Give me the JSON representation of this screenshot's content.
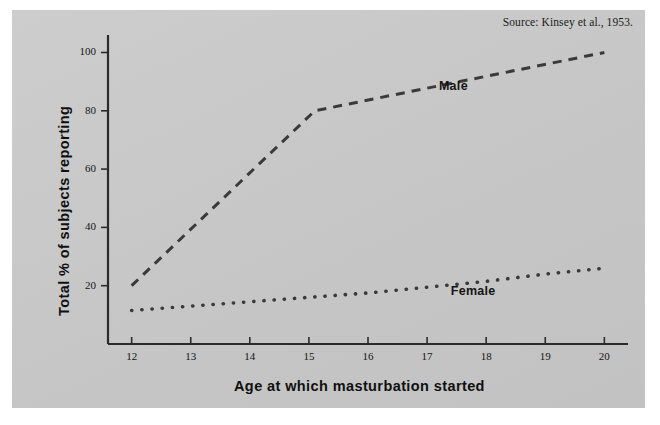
{
  "source_note": "Source: Kinsey et al., 1953.",
  "chart_data": {
    "type": "line",
    "title": "",
    "xlabel": "Age at which masturbation started",
    "ylabel": "Total % of subjects reporting",
    "x": [
      12,
      13,
      14,
      15,
      16,
      17,
      18,
      19,
      20
    ],
    "xtick_labels": [
      "12",
      "13",
      "14",
      "15",
      "16",
      "17",
      "18",
      "19",
      "20"
    ],
    "ytick_labels": [
      "20",
      "40",
      "60",
      "80",
      "100"
    ],
    "yticks": [
      20,
      40,
      60,
      80,
      100
    ],
    "xlim": [
      11.6,
      20.4
    ],
    "ylim": [
      0,
      106
    ],
    "grid": false,
    "legend_position": "inline-annotation",
    "series": [
      {
        "name": "Male",
        "style": "dashed",
        "color": "#3a3a3a",
        "label_x": 17.2,
        "label_y": 88,
        "x": [
          12,
          15.1,
          20
        ],
        "values": [
          20,
          80,
          100
        ]
      },
      {
        "name": "Female",
        "style": "dotted",
        "color": "#3a3a3a",
        "label_x": 17.4,
        "label_y": 18,
        "x": [
          12,
          13,
          14,
          15,
          16,
          17,
          18,
          19,
          20
        ],
        "values": [
          11.5,
          13,
          14.5,
          16,
          17.5,
          19.5,
          21.5,
          24,
          26
        ]
      }
    ]
  }
}
